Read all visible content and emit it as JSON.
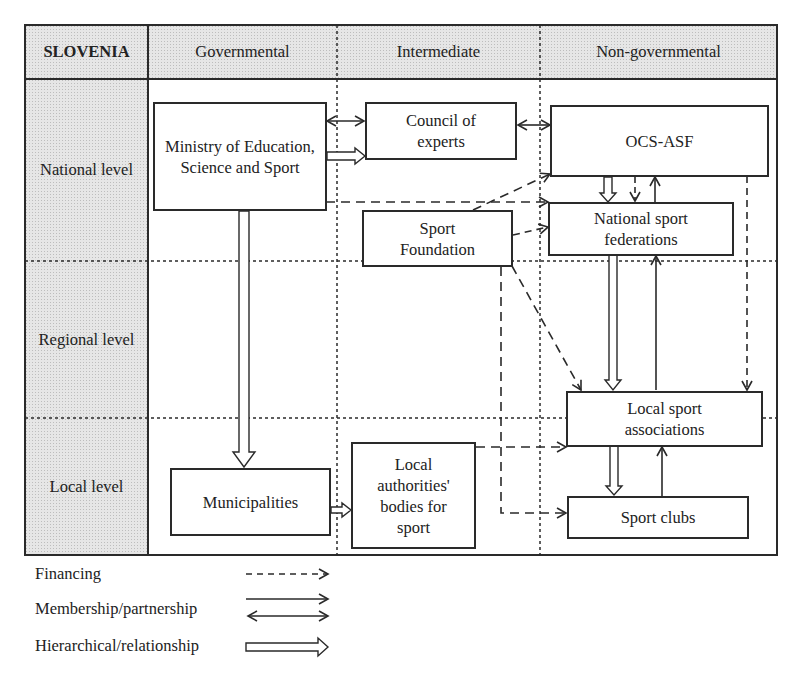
{
  "diagram": {
    "country": "SLOVENIA",
    "columns": [
      {
        "id": "governmental",
        "label": "Governmental"
      },
      {
        "id": "intermediate",
        "label": "Intermediate"
      },
      {
        "id": "non_governmental",
        "label": "Non-governmental"
      }
    ],
    "rows": [
      {
        "id": "national",
        "label": "National level"
      },
      {
        "id": "regional",
        "label": "Regional level"
      },
      {
        "id": "local",
        "label": "Local level"
      }
    ],
    "nodes": {
      "ministry": {
        "label": "Ministry of Education, Science and Sport",
        "column": "governmental",
        "row": "national"
      },
      "council": {
        "label": "Council of experts",
        "column": "intermediate",
        "row": "national"
      },
      "ocs_asf": {
        "label": "OCS-ASF",
        "column": "non_governmental",
        "row": "national"
      },
      "national_federations": {
        "label": "National sport federations",
        "column": "non_governmental",
        "row": "national"
      },
      "sport_foundation": {
        "label": "Sport Foundation",
        "column": "intermediate",
        "row": "national"
      },
      "local_associations": {
        "label": "Local sport associations",
        "column": "non_governmental",
        "row": "regional/local"
      },
      "sport_clubs": {
        "label": "Sport clubs",
        "column": "non_governmental",
        "row": "local"
      },
      "municipalities": {
        "label": "Municipalities",
        "column": "governmental",
        "row": "local"
      },
      "local_authorities": {
        "label": "Local authorities' bodies for sport",
        "column": "intermediate",
        "row": "local"
      }
    },
    "edges": [
      {
        "from": "ministry",
        "to": "council",
        "type": "membership"
      },
      {
        "from": "ministry",
        "to": "council",
        "type": "hierarchical"
      },
      {
        "from": "council",
        "to": "ocs_asf",
        "type": "membership"
      },
      {
        "from": "ministry",
        "to": "national_federations",
        "type": "financing"
      },
      {
        "from": "sport_foundation",
        "to": "ocs_asf",
        "type": "financing"
      },
      {
        "from": "sport_foundation",
        "to": "national_federations",
        "type": "financing"
      },
      {
        "from": "ocs_asf",
        "to": "national_federations",
        "type": "hierarchical"
      },
      {
        "from": "ocs_asf",
        "to": "national_federations",
        "type": "financing"
      },
      {
        "from": "national_federations",
        "to": "ocs_asf",
        "type": "membership-one-way"
      },
      {
        "from": "ocs_asf",
        "to": "local_associations",
        "type": "financing"
      },
      {
        "from": "national_federations",
        "to": "local_associations",
        "type": "hierarchical"
      },
      {
        "from": "local_associations",
        "to": "national_federations",
        "type": "membership-one-way"
      },
      {
        "from": "sport_foundation",
        "to": "local_associations",
        "type": "financing"
      },
      {
        "from": "sport_foundation",
        "to": "sport_clubs",
        "type": "financing"
      },
      {
        "from": "local_authorities",
        "to": "local_associations",
        "type": "financing"
      },
      {
        "from": "local_associations",
        "to": "sport_clubs",
        "type": "hierarchical"
      },
      {
        "from": "sport_clubs",
        "to": "local_associations",
        "type": "membership-one-way"
      },
      {
        "from": "ministry",
        "to": "municipalities",
        "type": "hierarchical"
      },
      {
        "from": "municipalities",
        "to": "local_authorities",
        "type": "hierarchical"
      }
    ]
  },
  "legend": [
    {
      "label": "Financing",
      "style": "dashed-arrow"
    },
    {
      "label": "Membership/partnership",
      "style": "solid-arrow-and-double-headed-arrow"
    },
    {
      "label": "Hierarchical/relationship",
      "style": "hollow-block-arrow"
    }
  ]
}
